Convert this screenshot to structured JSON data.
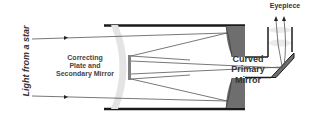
{
  "diagram": {
    "labels": {
      "light_source": "Light from a star",
      "correcting_plate": [
        "Correcting",
        "Plate and",
        "Secondary Mirror"
      ],
      "primary_mirror": [
        "Curved",
        "Primary",
        "Mirror"
      ],
      "eyepiece": "Eyepiece"
    },
    "colors": {
      "tube": "#1a1a1a",
      "mirror": "#666666",
      "corrector": "#dddddd",
      "rays": "#555555",
      "glow": "#e6e6e6"
    }
  }
}
